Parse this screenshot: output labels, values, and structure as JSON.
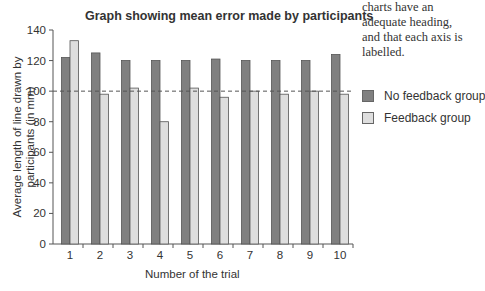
{
  "chart_data": {
    "type": "bar",
    "title": "Graph showing mean error made by participants",
    "xlabel": "Number of the trial",
    "ylabel": "Average length of line drawn by participants (in mm)",
    "categories": [
      "1",
      "2",
      "3",
      "4",
      "5",
      "6",
      "7",
      "8",
      "9",
      "10"
    ],
    "series": [
      {
        "name": "No feedback group",
        "color": "#808080",
        "values": [
          122,
          125,
          120,
          120,
          120,
          121,
          120,
          120,
          120,
          124
        ]
      },
      {
        "name": "Feedback group",
        "color": "#dedede",
        "values": [
          133,
          98,
          102,
          80,
          102,
          96,
          100,
          98,
          100,
          98
        ]
      }
    ],
    "ylim": [
      0,
      140
    ],
    "yticks": [
      0,
      20,
      40,
      60,
      80,
      100,
      120,
      140
    ],
    "reference_line": {
      "y": 100,
      "style": "dashed"
    },
    "grid": false,
    "legend_position": "right"
  },
  "note_text": "charts have an adequate heading, and that each axis is labelled."
}
